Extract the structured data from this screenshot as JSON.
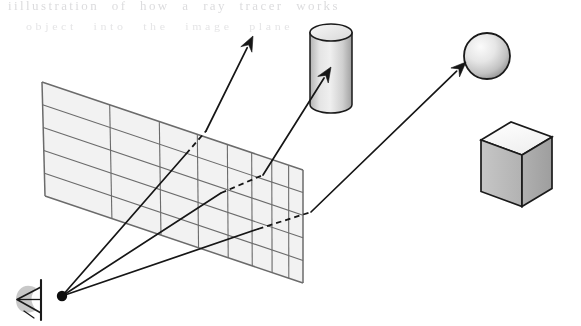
{
  "figure": {
    "background_color": "#ffffff",
    "width": 581,
    "height": 326,
    "ghost_text": {
      "line1": "iillustration of how a ray tracer works",
      "line2": "object    into    the    image   plane"
    },
    "colors": {
      "ink": "#1a1a1a",
      "grid_line": "#6b6b6b",
      "grid_fill": "#f2f2f2",
      "grid_fill_alt": "#ededed",
      "object_outline": "#1a1a1a",
      "sphere_light": "#f6f6f6",
      "sphere_dark": "#8e8e8e",
      "cylinder_light": "#e9e9e9",
      "cylinder_dark": "#9a9a9a",
      "cube_top": "#fdfdfd",
      "cube_left": "#bdbdbd",
      "cube_right": "#a9a9a9",
      "ray_color": "#161616"
    }
  },
  "viewpoint": {
    "label": "eye",
    "icon": "eye-icon",
    "origin_x": 62,
    "origin_y": 296,
    "dot_radius": 5.2
  },
  "image_plane": {
    "label": "image plane grid",
    "columns": 8,
    "rows": 5,
    "corners": {
      "top_left": [
        42,
        82
      ],
      "top_right": [
        303,
        170
      ],
      "bottom_right": [
        303,
        283
      ],
      "bottom_left": [
        45,
        196
      ]
    }
  },
  "rays": [
    {
      "name": "ray-to-empty-space",
      "from": [
        62,
        296
      ],
      "plane_entry": [
        186,
        154
      ],
      "plane_exit": [
        206,
        131
      ],
      "tip": [
        253,
        36
      ],
      "hits": "none",
      "arrow_length": 15,
      "arrow_width": 6.2
    },
    {
      "name": "ray-to-cylinder",
      "from": [
        62,
        296
      ],
      "plane_entry": [
        221,
        193
      ],
      "plane_exit": [
        263,
        175
      ],
      "tip": [
        331,
        67
      ],
      "hits": "cylinder",
      "arrow_length": 15,
      "arrow_width": 6.2
    },
    {
      "name": "ray-to-sphere",
      "from": [
        62,
        296
      ],
      "plane_entry": [
        258,
        229
      ],
      "plane_exit": [
        311,
        212
      ],
      "tip": [
        466,
        62
      ],
      "hits": "sphere",
      "arrow_length": 15,
      "arrow_width": 6.2
    }
  ],
  "objects": [
    {
      "name": "cylinder",
      "shape": "cylinder",
      "center_x": 331,
      "top_y": 24,
      "bottom_y": 113,
      "radius_x": 21,
      "radius_y": 8.5
    },
    {
      "name": "sphere",
      "shape": "sphere",
      "center_x": 487,
      "center_y": 56,
      "radius": 23
    },
    {
      "name": "cube",
      "shape": "cube",
      "front_left": [
        481,
        140
      ],
      "top_apex": [
        511,
        122
      ],
      "right": [
        552,
        137
      ],
      "front_bottom": [
        512,
        190
      ]
    }
  ]
}
